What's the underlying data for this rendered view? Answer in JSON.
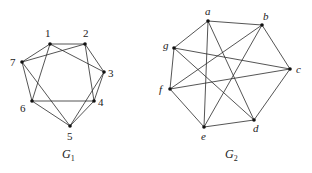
{
  "graphs": [
    {
      "name": "G1",
      "caption": {
        "main": "G",
        "sub": "1"
      },
      "caption_pos": [
        62,
        158
      ],
      "nodes": [
        {
          "id": "1",
          "x": 50,
          "y": 44,
          "lx": 45,
          "ly": 37
        },
        {
          "id": "2",
          "x": 85,
          "y": 44,
          "lx": 83,
          "ly": 37
        },
        {
          "id": "3",
          "x": 104,
          "y": 72,
          "lx": 108,
          "ly": 77
        },
        {
          "id": "4",
          "x": 94,
          "y": 101,
          "lx": 98,
          "ly": 106
        },
        {
          "id": "5",
          "x": 70,
          "y": 126,
          "lx": 67,
          "ly": 140
        },
        {
          "id": "6",
          "x": 32,
          "y": 101,
          "lx": 20,
          "ly": 112
        },
        {
          "id": "7",
          "x": 22,
          "y": 62,
          "lx": 10,
          "ly": 66
        }
      ],
      "edges": [
        [
          "1",
          "2"
        ],
        [
          "1",
          "3"
        ],
        [
          "1",
          "6"
        ],
        [
          "1",
          "7"
        ],
        [
          "2",
          "7"
        ],
        [
          "2",
          "3"
        ],
        [
          "2",
          "4"
        ],
        [
          "7",
          "6"
        ],
        [
          "7",
          "5"
        ],
        [
          "6",
          "4"
        ],
        [
          "6",
          "5"
        ],
        [
          "5",
          "4"
        ],
        [
          "5",
          "3"
        ],
        [
          "3",
          "4"
        ]
      ]
    },
    {
      "name": "G2",
      "caption": {
        "main": "G",
        "sub": "2"
      },
      "caption_pos": [
        225,
        158
      ],
      "nodes": [
        {
          "id": "a",
          "x": 208,
          "y": 21,
          "lx": 205,
          "ly": 15
        },
        {
          "id": "b",
          "x": 262,
          "y": 25,
          "lx": 263,
          "ly": 20
        },
        {
          "id": "c",
          "x": 290,
          "y": 69,
          "lx": 296,
          "ly": 73
        },
        {
          "id": "d",
          "x": 254,
          "y": 120,
          "lx": 253,
          "ly": 132
        },
        {
          "id": "e",
          "x": 204,
          "y": 127,
          "lx": 201,
          "ly": 140
        },
        {
          "id": "f",
          "x": 170,
          "y": 89,
          "lx": 159,
          "ly": 93
        },
        {
          "id": "g",
          "x": 174,
          "y": 48,
          "lx": 163,
          "ly": 49
        }
      ],
      "edges": [
        [
          "a",
          "b"
        ],
        [
          "a",
          "g"
        ],
        [
          "a",
          "e"
        ],
        [
          "a",
          "d"
        ],
        [
          "b",
          "f"
        ],
        [
          "b",
          "e"
        ],
        [
          "b",
          "c"
        ],
        [
          "g",
          "c"
        ],
        [
          "g",
          "d"
        ],
        [
          "g",
          "f"
        ],
        [
          "f",
          "c"
        ],
        [
          "f",
          "e"
        ],
        [
          "e",
          "d"
        ],
        [
          "d",
          "c"
        ]
      ]
    }
  ]
}
